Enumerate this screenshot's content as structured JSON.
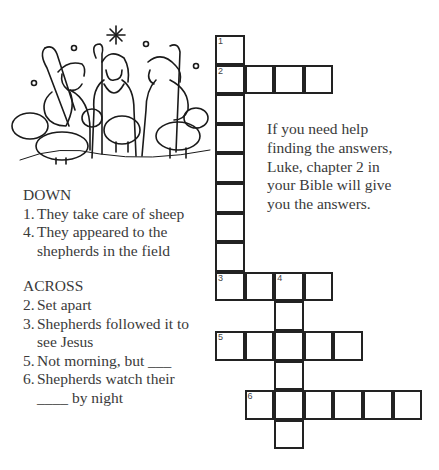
{
  "clues": {
    "down_heading": "DOWN",
    "down": [
      {
        "num": "1.",
        "text": "They take care of sheep"
      },
      {
        "num": "4.",
        "text": "They appeared to the\nshepherds in the field"
      }
    ],
    "across_heading": "ACROSS",
    "across": [
      {
        "num": "2.",
        "text": "Set apart"
      },
      {
        "num": "3.",
        "text": "Shepherds followed it to\nsee Jesus"
      },
      {
        "num": "5.",
        "text": "Not morning, but ___"
      },
      {
        "num": "6.",
        "text": "Shepherds watch their\n____ by night"
      }
    ]
  },
  "help_text": "If you need help finding the answers, Luke, chapter 2 in your Bible will give you the answers.",
  "grid": {
    "cell_size": 29.6,
    "origin_x": 215,
    "origin_y": 35,
    "cells": [
      {
        "r": 0,
        "c": 0,
        "n": "1"
      },
      {
        "r": 1,
        "c": 0,
        "n": "2"
      },
      {
        "r": 1,
        "c": 1
      },
      {
        "r": 1,
        "c": 2
      },
      {
        "r": 1,
        "c": 3
      },
      {
        "r": 2,
        "c": 0
      },
      {
        "r": 3,
        "c": 0
      },
      {
        "r": 4,
        "c": 0
      },
      {
        "r": 5,
        "c": 0
      },
      {
        "r": 6,
        "c": 0
      },
      {
        "r": 7,
        "c": 0
      },
      {
        "r": 8,
        "c": 0,
        "n": "3"
      },
      {
        "r": 8,
        "c": 1
      },
      {
        "r": 8,
        "c": 2,
        "n": "4"
      },
      {
        "r": 8,
        "c": 3
      },
      {
        "r": 9,
        "c": 2
      },
      {
        "r": 10,
        "c": 0,
        "n": "5"
      },
      {
        "r": 10,
        "c": 1
      },
      {
        "r": 10,
        "c": 2
      },
      {
        "r": 10,
        "c": 3
      },
      {
        "r": 10,
        "c": 4
      },
      {
        "r": 11,
        "c": 2
      },
      {
        "r": 12,
        "c": 1,
        "n": "6"
      },
      {
        "r": 12,
        "c": 2
      },
      {
        "r": 12,
        "c": 3
      },
      {
        "r": 12,
        "c": 4
      },
      {
        "r": 12,
        "c": 5
      },
      {
        "r": 12,
        "c": 6
      },
      {
        "r": 13,
        "c": 2
      }
    ]
  },
  "illustration": {
    "subject": "Shepherds with staffs and sheep under a star"
  }
}
